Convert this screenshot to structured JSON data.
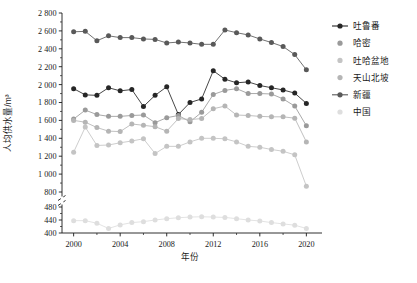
{
  "chart_data": {
    "type": "line",
    "title": "",
    "xlabel": "年份",
    "ylabel": "人均供水量/m³",
    "x": [
      2000,
      2001,
      2002,
      2003,
      2004,
      2005,
      2006,
      2007,
      2008,
      2009,
      2010,
      2011,
      2012,
      2013,
      2014,
      2015,
      2016,
      2017,
      2018,
      2019,
      2020
    ],
    "xlim": [
      1999,
      2021
    ],
    "xticks": [
      2000,
      2004,
      2008,
      2012,
      2016,
      2020
    ],
    "xtick_labels": [
      "2000",
      "2004",
      "2008",
      "2012",
      "2016",
      "2020"
    ],
    "ylim": [
      400,
      2800
    ],
    "yticks": [
      400,
      440,
      480,
      800,
      1000,
      1200,
      1400,
      1600,
      1800,
      2000,
      2200,
      2400,
      2600,
      2800
    ],
    "ytick_labels": [
      "400",
      "440",
      "480",
      "800",
      "1 000",
      "1 200",
      "1 400",
      "1 600",
      "1 800",
      "2 000",
      "2 200",
      "2 400",
      "2 600",
      "2 800"
    ],
    "axis_break": {
      "lower": 480,
      "upper": 800,
      "note": "y-axis broken between 480 and 800"
    },
    "grid": false,
    "legend_position": "right",
    "series": [
      {
        "name": "吐鲁番",
        "color": "#262626",
        "values": [
          1955,
          1885,
          1880,
          1965,
          1930,
          1945,
          1755,
          1880,
          1975,
          1665,
          1800,
          1840,
          2155,
          2060,
          2020,
          2030,
          1990,
          1965,
          1940,
          1905,
          1790
        ]
      },
      {
        "name": "哈密",
        "color": "#9a9a9a",
        "values": [
          1615,
          1715,
          1665,
          1645,
          1645,
          1655,
          1660,
          1575,
          1630,
          1655,
          1585,
          1690,
          1890,
          1935,
          1955,
          1900,
          1900,
          1895,
          1840,
          1760,
          1540
        ]
      },
      {
        "name": "吐哈盆地",
        "color": "#c4c4c4",
        "values": [
          1245,
          1525,
          1320,
          1325,
          1350,
          1370,
          1395,
          1230,
          1310,
          1310,
          1360,
          1400,
          1400,
          1395,
          1360,
          1310,
          1300,
          1275,
          1255,
          1215,
          865
        ]
      },
      {
        "name": "天山北坡",
        "color": "#b5b5b5",
        "values": [
          1600,
          1580,
          1520,
          1480,
          1475,
          1560,
          1545,
          1530,
          1480,
          1620,
          1610,
          1620,
          1730,
          1760,
          1660,
          1655,
          1645,
          1640,
          1640,
          1625,
          1360
        ]
      },
      {
        "name": "新疆",
        "color": "#595959",
        "values": [
          2590,
          2595,
          2490,
          2545,
          2525,
          2525,
          2510,
          2505,
          2465,
          2475,
          2465,
          2450,
          2450,
          2610,
          2580,
          2555,
          2510,
          2470,
          2425,
          2335,
          2165
        ]
      },
      {
        "name": "中国",
        "color": "#dedede",
        "values": [
          438,
          438,
          430,
          414,
          425,
          432,
          435,
          440,
          444,
          447,
          449,
          450,
          449,
          448,
          444,
          440,
          437,
          432,
          428,
          424,
          414
        ]
      }
    ]
  },
  "legend": {
    "items": [
      {
        "label": "吐鲁番",
        "color": "#262626",
        "has_line": true
      },
      {
        "label": "哈密",
        "color": "#9a9a9a",
        "has_line": false
      },
      {
        "label": "吐哈盆地",
        "color": "#c4c4c4",
        "has_line": false
      },
      {
        "label": "天山北坡",
        "color": "#b5b5b5",
        "has_line": false
      },
      {
        "label": "新疆",
        "color": "#595959",
        "has_line": true
      },
      {
        "label": "中国",
        "color": "#dedede",
        "has_line": false
      }
    ]
  }
}
